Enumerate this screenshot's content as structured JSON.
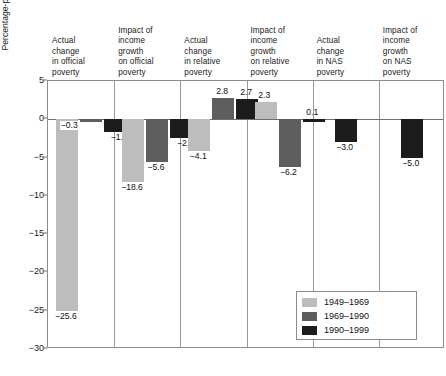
{
  "chart_data": {
    "type": "bar",
    "title": "",
    "xlabel": "",
    "ylabel": "Percentage-point change in poverty rate",
    "ylim": [
      -30,
      5
    ],
    "yticks": [
      5,
      0,
      -5,
      -10,
      -15,
      -20,
      -25,
      -30
    ],
    "ytick_labels": [
      "5",
      "0",
      "−5",
      "−10",
      "−15",
      "−20",
      "−25",
      "−30"
    ],
    "grid": false,
    "legend_position": "bottom-right",
    "categories": [
      "Actual change in official poverty",
      "Impact of income growth on official poverty",
      "Actual change in relative poverty",
      "Impact of income growth on relative poverty",
      "Actual change in NAS poverty",
      "Impact of income growth on NAS poverty"
    ],
    "category_lines": [
      [
        "Actual",
        "change",
        "in official",
        "poverty"
      ],
      [
        "Impact of",
        "income",
        "growth",
        "on official",
        "poverty"
      ],
      [
        "Actual",
        "change",
        "in relative",
        "poverty"
      ],
      [
        "Impact of",
        "income",
        "growth",
        "on relative",
        "poverty"
      ],
      [
        "Actual",
        "change",
        "in NAS",
        "poverty"
      ],
      [
        "Impact of",
        "income",
        "growth",
        "on NAS",
        "poverty"
      ]
    ],
    "series": [
      {
        "name": "1949–1969",
        "color": "#bdbdbd",
        "values": [
          -25.6,
          -18.6,
          -4.1,
          2.3,
          null,
          null
        ],
        "labels": [
          "−25.6",
          "−18.6",
          "−4.1",
          "2.3",
          "",
          ""
        ]
      },
      {
        "name": "1969–1990",
        "color": "#5e5e5e",
        "values": [
          -0.3,
          -5.6,
          2.8,
          -6.2,
          null,
          null
        ],
        "labels": [
          "−0.3",
          "−5.6",
          "2.8",
          "−6.2",
          "",
          ""
        ]
      },
      {
        "name": "1990–1999",
        "color": "#1c1c1c",
        "values": [
          -1.7,
          -2.5,
          2.7,
          0.1,
          -3.0,
          -5.0
        ],
        "labels": [
          "−1.7",
          "−2.5",
          "2.7",
          "0.1",
          "−3.0",
          "−5.0"
        ]
      }
    ]
  },
  "legend": {
    "entries": [
      {
        "label": "1949–1969",
        "color": "#bdbdbd"
      },
      {
        "label": "1969–1990",
        "color": "#5e5e5e"
      },
      {
        "label": "1990–1999",
        "color": "#1c1c1c"
      }
    ]
  }
}
